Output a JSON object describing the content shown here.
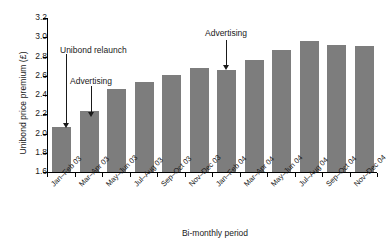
{
  "chart_data": {
    "type": "bar",
    "title": "",
    "xlabel": "Bi-monthly period",
    "ylabel": "Unibond price premium (£)",
    "ylim": [
      1.6,
      3.2
    ],
    "ytick_step": 0.2,
    "grid": false,
    "legend": "none",
    "bar_color": "#7d7d7d",
    "axis_color": "#000000",
    "categories": [
      "Jan–Feb 03",
      "Mar–Apr 03",
      "May–Jun 03",
      "Jul–Aug 03",
      "Sep–Oct 03",
      "Nov–Dec 03",
      "Jan–Feb 04",
      "Mar–Apr 04",
      "May–Jun 04",
      "Jul–Aug 04",
      "Sep–Oct 04",
      "Nov–Dec 04"
    ],
    "values": [
      2.07,
      2.23,
      2.46,
      2.54,
      2.61,
      2.68,
      2.66,
      2.76,
      2.87,
      2.96,
      2.92,
      2.91
    ],
    "yticks": [
      "3.2",
      "3.0",
      "2.8",
      "2.6",
      "2.4",
      "2.2",
      "2.0",
      "1.8",
      "1.6"
    ],
    "ytick_values": [
      3.2,
      3.0,
      2.8,
      2.6,
      2.4,
      2.2,
      2.0,
      1.8,
      1.6
    ],
    "annotations": [
      {
        "label": "Unibond relaunch",
        "target_category": "Jan–Feb 03",
        "target_index": 0,
        "label_x": 60,
        "label_y": 45,
        "arrow_x": 66,
        "arrow_top": 54,
        "arrow_bottom": 128
      },
      {
        "label": "Advertising",
        "target_category": "Mar–Apr 03",
        "target_index": 1,
        "label_x": 70,
        "label_y": 76,
        "arrow_x": 91,
        "arrow_top": 86,
        "arrow_bottom": 117
      },
      {
        "label": "Advertising",
        "target_category": "Jan–Feb 04",
        "target_index": 6,
        "label_x": 205,
        "label_y": 28,
        "arrow_x": 226,
        "arrow_top": 40,
        "arrow_bottom": 70
      }
    ]
  }
}
